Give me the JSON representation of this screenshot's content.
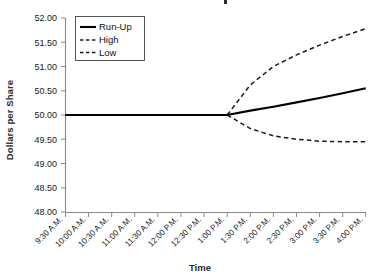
{
  "chart_data": {
    "type": "line",
    "title": "",
    "xlabel": "Time",
    "ylabel": "Dollars per Share",
    "x": [
      "9:30 A.M.",
      "10:00 A.M.",
      "10:30 A.M.",
      "11:00 A.M.",
      "11:30 A.M.",
      "12:00 P.M.",
      "12:30 P.M.",
      "1:00 P.M.",
      "1:30 P.M.",
      "2:00 P.M.",
      "2:30 P.M.",
      "3:00 P.M.",
      "3:30 P.M.",
      "4:00 P.M."
    ],
    "xtick_labels": [
      "9:30 A.M.",
      "10:00 A.M.",
      "10:30 A.M.",
      "11:00 A.M.",
      "11:30 A.M.",
      "12:00 P.M.",
      "12:30 P.M.",
      "1:00 P.M.",
      "1:30 P.M.",
      "2:00 P.M.",
      "2:30 P.M.",
      "3:00 P.M.",
      "3:30 P.M.",
      "4:00 P.M."
    ],
    "ytick_labels": [
      "48.00",
      "48.50",
      "49.00",
      "49.50",
      "50.00",
      "50.50",
      "51.00",
      "51.50",
      "52.00"
    ],
    "ylim": [
      48.0,
      52.0
    ],
    "ytick_step": 0.5,
    "grid": false,
    "legend_position": "top-left",
    "fan_start_label": "1:00 P.M.",
    "series": [
      {
        "name": "Run-Up",
        "style": "solid",
        "color": "#000000",
        "values": [
          50.0,
          50.0,
          50.0,
          50.0,
          50.0,
          50.0,
          50.0,
          50.0,
          50.09,
          50.17,
          50.26,
          50.35,
          50.45,
          50.55
        ]
      },
      {
        "name": "High",
        "style": "dashed",
        "color": "#1a1a1a",
        "values": [
          50.0,
          50.0,
          50.0,
          50.0,
          50.0,
          50.0,
          50.0,
          50.0,
          50.62,
          51.0,
          51.24,
          51.44,
          51.62,
          51.78
        ]
      },
      {
        "name": "Low",
        "style": "dashed",
        "color": "#1a1a1a",
        "values": [
          50.0,
          50.0,
          50.0,
          50.0,
          50.0,
          50.0,
          50.0,
          50.0,
          49.72,
          49.57,
          49.5,
          49.46,
          49.45,
          49.45
        ]
      }
    ]
  },
  "legend": {
    "entries": [
      {
        "label": "Run-Up"
      },
      {
        "label": "High"
      },
      {
        "label": "Low"
      }
    ]
  },
  "axes": {
    "y_title": "Dollars per Share",
    "x_title": "Time"
  }
}
